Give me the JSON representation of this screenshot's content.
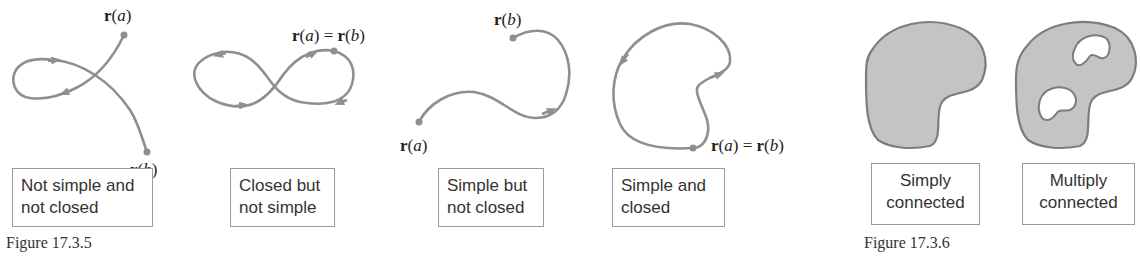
{
  "figures": [
    {
      "caption": "Figure 17.3.5",
      "panels": [
        {
          "label_line1": "Not simple and",
          "label_line2": "not closed",
          "points": [
            {
              "text": "r(a)"
            },
            {
              "text": "r(b)"
            }
          ]
        },
        {
          "label_line1": "Closed but",
          "label_line2": "not simple",
          "points": [
            {
              "text": "r(a) = r(b)"
            }
          ]
        },
        {
          "label_line1": "Simple but",
          "label_line2": "not closed",
          "points": [
            {
              "text": "r(b)"
            },
            {
              "text": "r(a)"
            }
          ]
        },
        {
          "label_line1": "Simple and",
          "label_line2": "closed",
          "points": [
            {
              "text": "r(a) = r(b)"
            }
          ]
        }
      ]
    },
    {
      "caption": "Figure 17.3.6",
      "panels": [
        {
          "label_line1": "Simply",
          "label_line2": "connected"
        },
        {
          "label_line1": "Multiply",
          "label_line2": "connected"
        }
      ]
    }
  ],
  "colors": {
    "stroke": "#8f8f8f",
    "fill": "#c4c4c4",
    "region_stroke": "#7d7d7d"
  }
}
